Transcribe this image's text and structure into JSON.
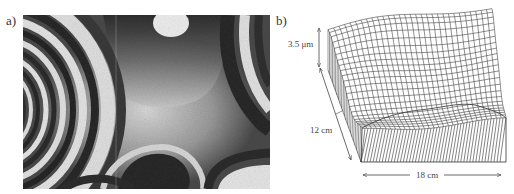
{
  "figure": {
    "panel_a": {
      "label": "a)",
      "description": "interference fringe pattern (grayscale)"
    },
    "panel_b": {
      "label": "b)",
      "description": "3D wireframe surface topography",
      "dimensions": {
        "height": "3.5 μm",
        "depth": "12 cm",
        "width": "18 cm"
      }
    }
  },
  "colors": {
    "background": "#ffffff",
    "line": "#333333",
    "fringe_dark": "#1e1e1e",
    "fringe_light": "#e8e8e8"
  }
}
